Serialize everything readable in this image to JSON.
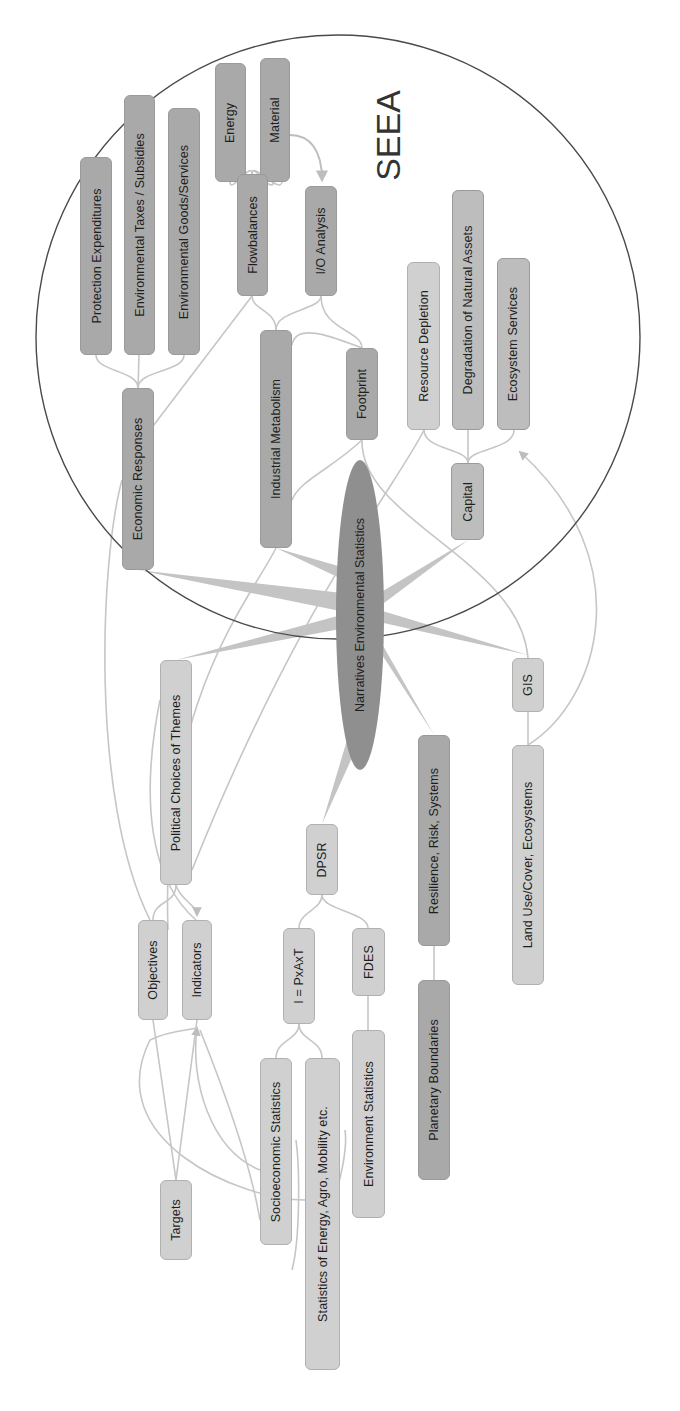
{
  "diagram": {
    "type": "mind-map",
    "orientation": "rotated-90-ccw",
    "boundary_label": "SEEA",
    "center": {
      "label": "Narratives Environmental Statistics"
    },
    "nodes": {
      "protection_expenditures": "Protection Expenditures",
      "environmental_taxes": "Environmental Taxes / Subsidies",
      "environmental_goods": "Environmental Goods/Services",
      "energy": "Energy",
      "material": "Material",
      "flowbalances": "Flowbalances",
      "io_analysis": "I/O Analysis",
      "industrial_metabolism": "Industrial Metabolism",
      "footprint": "Footprint",
      "economic_responses": "Economic Responses",
      "resource_depletion": "Resource Depletion",
      "degradation": "Degradation of Natural Assets",
      "ecosystem_services": "Ecosystem Services",
      "capital": "Capital",
      "political_choices": "Political Choices of Themes",
      "gis": "GIS",
      "resilience": "Resilience, Risk, Systems",
      "land_use": "Land Use/Cover, Ecosystems",
      "dpsr": "DPSR",
      "objectives": "Objectives",
      "indicators": "Indicators",
      "ipat": "I = PxAxT",
      "fdes": "FDES",
      "socioeconomic": "Socioeconomic Statistics",
      "statistics_energy": "Statistics of Energy, Agro, Mobility etc.",
      "environment_statistics": "Environment Statistics",
      "planetary_boundaries": "Planetary Boundaries",
      "targets": "Targets"
    },
    "edges": [
      [
        "Narratives Environmental Statistics",
        "Economic Responses"
      ],
      [
        "Narratives Environmental Statistics",
        "Industrial Metabolism"
      ],
      [
        "Narratives Environmental Statistics",
        "Capital"
      ],
      [
        "Narratives Environmental Statistics",
        "Political Choices of Themes"
      ],
      [
        "Narratives Environmental Statistics",
        "GIS"
      ],
      [
        "Narratives Environmental Statistics",
        "Resilience, Risk, Systems"
      ],
      [
        "Narratives Environmental Statistics",
        "DPSR"
      ],
      [
        "Economic Responses",
        "Protection Expenditures"
      ],
      [
        "Economic Responses",
        "Environmental Taxes / Subsidies"
      ],
      [
        "Economic Responses",
        "Environmental Goods/Services"
      ],
      [
        "Industrial Metabolism",
        "Flowbalances"
      ],
      [
        "Industrial Metabolism",
        "I/O Analysis"
      ],
      [
        "Flowbalances",
        "Energy"
      ],
      [
        "Flowbalances",
        "Material"
      ],
      [
        "Material",
        "I/O Analysis"
      ],
      [
        "I/O Analysis",
        "Footprint"
      ],
      [
        "Flowbalances",
        "Footprint"
      ],
      [
        "Capital",
        "Resource Depletion"
      ],
      [
        "Capital",
        "Degradation of Natural Assets"
      ],
      [
        "Capital",
        "Ecosystem Services"
      ],
      [
        "Land Use/Cover, Ecosystems",
        "Ecosystem Services"
      ],
      [
        "GIS",
        "Land Use/Cover, Ecosystems"
      ],
      [
        "Resilience, Risk, Systems",
        "Planetary Boundaries"
      ],
      [
        "DPSR",
        "I = PxAxT"
      ],
      [
        "DPSR",
        "FDES"
      ],
      [
        "FDES",
        "Environment Statistics"
      ],
      [
        "I = PxAxT",
        "Socioeconomic Statistics"
      ],
      [
        "I = PxAxT",
        "Statistics of Energy, Agro, Mobility etc."
      ],
      [
        "Political Choices of Themes",
        "Objectives"
      ],
      [
        "Political Choices of Themes",
        "Indicators"
      ],
      [
        "Objectives",
        "Targets"
      ],
      [
        "Socioeconomic Statistics",
        "Indicators"
      ],
      [
        "Statistics of Energy, Agro, Mobility etc.",
        "Indicators"
      ],
      [
        "Economic Responses",
        "Indicators"
      ],
      [
        "Industrial Metabolism",
        "Indicators"
      ],
      [
        "Footprint",
        "Political Choices of Themes"
      ],
      [
        "Resource Depletion",
        "Political Choices of Themes"
      ],
      [
        "Footprint",
        "GIS"
      ]
    ],
    "colors": {
      "node_dark": "#a9a9a9",
      "node_mid": "#bdbdbd",
      "node_light": "#d0d0d0",
      "center": "#8f8f8f",
      "edge": "#c8c8c8",
      "boundary": "#444444"
    }
  }
}
